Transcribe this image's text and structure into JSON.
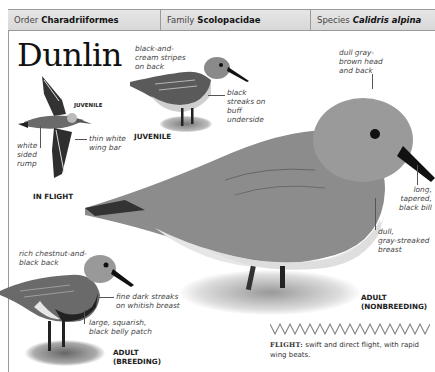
{
  "header": {
    "order_label": "Order",
    "order_value": "Charadriiformes",
    "family_label": "Family",
    "family_value": "Scolopacidae",
    "species_label": "Species",
    "species_value": "Calidris alpina"
  },
  "title": "Dunlin",
  "in_flight": {
    "juvenile_tag": "JUVENILE",
    "caption": "IN FLIGHT",
    "labels": {
      "rump": "white sided rump",
      "rump_lines": [
        "white",
        "sided",
        "rump"
      ],
      "wing_bar_lines": [
        "thin white",
        "wing bar"
      ]
    }
  },
  "juvenile": {
    "caption": "JUVENILE",
    "back_lines": [
      "black-and-",
      "cream stripes",
      "on back"
    ],
    "underside_lines": [
      "black",
      "streaks on",
      "buff",
      "underside"
    ]
  },
  "adult_nonbreeding": {
    "caption_lines": [
      "ADULT",
      "(NONBREEDING)"
    ],
    "head_lines": [
      "dull gray-",
      "brown head",
      "and back"
    ],
    "bill_lines": [
      "long,",
      "tapered,",
      "black bill"
    ],
    "breast_lines": [
      "dull,",
      "gray-streaked",
      "breast"
    ]
  },
  "adult_breeding": {
    "caption_lines": [
      "ADULT",
      "(BREEDING)"
    ],
    "back_lines": [
      "rich chestnut-and-",
      "black back"
    ],
    "breast_lines": [
      "fine dark streaks",
      "on whitish breast"
    ],
    "belly_lines": [
      "large, squarish,",
      "black belly patch"
    ]
  },
  "flight_note": {
    "key": "FLIGHT:",
    "text": " swift and direct flight, with rapid wing beats."
  },
  "colors": {
    "header_bg": "#dcdcdc",
    "rule": "#9a9a9a",
    "text": "#222222"
  }
}
